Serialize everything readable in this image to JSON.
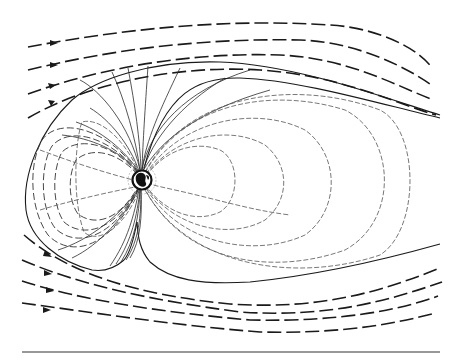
{
  "figure": {
    "width": 457,
    "height": 360,
    "colors": {
      "ink": "#1a1a1a",
      "background": "#ffffff",
      "earth": "#111111"
    },
    "elements": {
      "solar_wind_lines": 8,
      "solar_wind_direction": "left-to-right",
      "earth_position": [
        142,
        180
      ],
      "baseline_y": 352
    },
    "labels": []
  }
}
